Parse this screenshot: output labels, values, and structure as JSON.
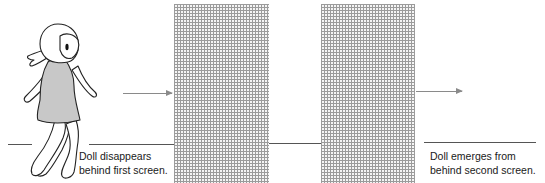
{
  "figure": {
    "captions": {
      "left": {
        "line1": "Doll disappears",
        "line2": "behind first screen."
      },
      "right": {
        "line1": "Doll emerges from",
        "line2": "behind second screen."
      }
    },
    "elements": {
      "doll": "walking-doll-illustration",
      "screens": [
        "first-screen",
        "second-screen"
      ],
      "arrows": [
        "motion-arrow-into-first-screen",
        "motion-arrow-out-of-second-screen"
      ]
    },
    "colors": {
      "screen_grid": "#8a8a8a",
      "doll_dress": "#c8c8c8",
      "line": "#555555",
      "text": "#1a1a1a"
    }
  }
}
